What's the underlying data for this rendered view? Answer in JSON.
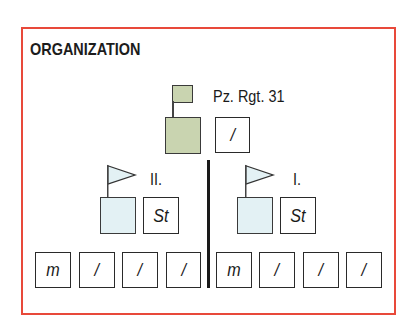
{
  "diagram": {
    "title": "ORGANIZATION",
    "colors": {
      "frame": "#e8493a",
      "hq_fill": "#c9d4b0",
      "battalion_fill": "#e3f1f4",
      "line": "#1a1a1a"
    },
    "regiment": {
      "label": "Pz. Rgt. 31",
      "staff_unit": "/"
    },
    "battalions": [
      {
        "label": "II.",
        "staff_unit": "St",
        "companies": [
          "m",
          "/",
          "/",
          "/"
        ]
      },
      {
        "label": "I.",
        "staff_unit": "St",
        "companies": [
          "m",
          "/",
          "/",
          "/"
        ]
      }
    ]
  }
}
